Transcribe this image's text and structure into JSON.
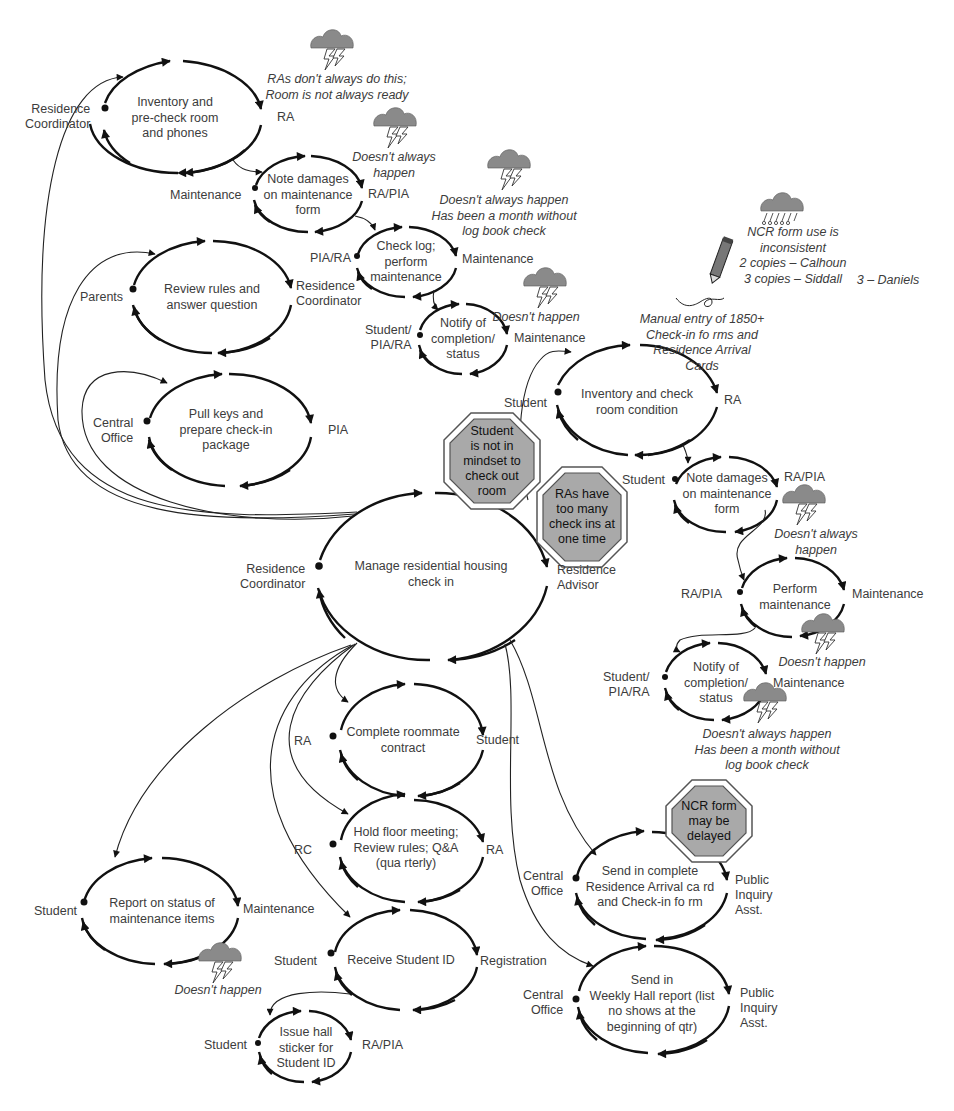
{
  "diagram": {
    "title": "Manage residential housing check in",
    "colors": {
      "line": "#111111",
      "text": "#3c3c3c",
      "stop_fill": "#a9a9a9",
      "stop_border": "#555555",
      "cloud_fill": "#8a8a8a"
    }
  },
  "loops": [
    {
      "id": "inventory-precheck",
      "text": "Inventory and\npre-check  room\nand phones",
      "customer": "Residence\nCoordinator",
      "performer": "RA"
    },
    {
      "id": "note-damages-top",
      "text": "Note damages\non maintenance\nform",
      "customer": "Maintenance",
      "performer": "RA/PIA"
    },
    {
      "id": "check-log",
      "text": "Check log;\nperform\nmaintenance",
      "customer": "PIA/RA",
      "performer": "Maintenance"
    },
    {
      "id": "notify-top",
      "text": "Notify of\ncompletion/\nstatus",
      "customer": "Student/\nPIA/RA",
      "performer": "Maintenance"
    },
    {
      "id": "review-rules",
      "text": "Review rules and\nanswer question",
      "customer": "Parents",
      "performer": "Residence\nCoordinator"
    },
    {
      "id": "pull-keys",
      "text": "Pull keys and\nprepare check-in\npackage",
      "customer": "Central\nOffice",
      "performer": "PIA"
    },
    {
      "id": "manage-checkin",
      "text": "Manage residential housing\ncheck in",
      "customer": "Residence\nCoordinator",
      "performer": "Residence\nAdvisor"
    },
    {
      "id": "inventory-check-room",
      "text": "Inventory and check\nroom condition",
      "customer": "Student",
      "performer": "RA"
    },
    {
      "id": "note-damages-right",
      "text": "Note damages\non maintenance\nform",
      "customer": "Student",
      "performer": "RA/PIA"
    },
    {
      "id": "perform-maintenance",
      "text": "Perform\nmaintenance",
      "customer": "RA/PIA",
      "performer": "Maintenance"
    },
    {
      "id": "notify-right",
      "text": "Notify of\ncompletion/\nstatus",
      "customer": "Student/\nPIA/RA",
      "performer": "Maintenance"
    },
    {
      "id": "roommate-contract",
      "text": "Complete roommate\ncontract",
      "customer": "RA",
      "performer": "Student"
    },
    {
      "id": "floor-meeting",
      "text": "Hold floor meeting;\nReview rules; Q&A\n(qua rterly)",
      "customer": "RC",
      "performer": "RA"
    },
    {
      "id": "report-status",
      "text": "Report on status of\nmaintenance items",
      "customer": "Student",
      "performer": "Maintenance"
    },
    {
      "id": "receive-id",
      "text": "Receive Student ID",
      "customer": "Student",
      "performer": "Registration"
    },
    {
      "id": "hall-sticker",
      "text": "Issue hall\nsticker for\nStudent ID",
      "customer": "Student",
      "performer": "RA/PIA"
    },
    {
      "id": "send-arrival-card",
      "text": "Send in complete\nResidence Arrival ca rd\nand Check-in fo rm",
      "customer": "Central\nOffice",
      "performer": "Public\nInquiry\nAsst."
    },
    {
      "id": "weekly-hall-report",
      "text": "Send in\nWeekly Hall report (list\nno shows at the\nbeginning of qtr)",
      "customer": "Central\nOffice",
      "performer": "Public\nInquiry\nAsst."
    }
  ],
  "issues": [
    {
      "icon": "storm-cloud",
      "text": "RAs don't always do this;\nRoom is not always ready"
    },
    {
      "icon": "storm-cloud",
      "text": "Doesn't always\nhappen"
    },
    {
      "icon": "storm-cloud",
      "text": "Doesn't always happen\nHas been a month without\nlog book check"
    },
    {
      "icon": "storm-cloud",
      "text": "Doesn't happen"
    },
    {
      "icon": "rain-cloud",
      "text": "NCR form use is inconsistent\n2 copies – Calhoun\n3 copies – Siddall"
    },
    {
      "icon": "none",
      "text": "3 – Daniels"
    },
    {
      "icon": "pencil",
      "text": "Manual entry of 1850+\nCheck-in fo rms and\nResidence Arrival\nCards"
    },
    {
      "icon": "storm-cloud",
      "text": "Doesn't always\nhappen"
    },
    {
      "icon": "storm-cloud",
      "text": "Doesn't happen"
    },
    {
      "icon": "storm-cloud",
      "text": "Doesn't always happen\nHas been a month without\nlog book check"
    },
    {
      "icon": "storm-cloud",
      "text": "Doesn't happen"
    }
  ],
  "stop_signs": [
    {
      "text": "Student\nis not in\nmindset to\ncheck out\nroom"
    },
    {
      "text": "RAs have\ntoo many\ncheck ins at\none time"
    },
    {
      "text": "NCR form\nmay be\ndelayed"
    }
  ]
}
